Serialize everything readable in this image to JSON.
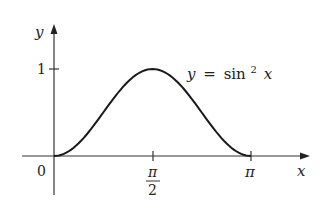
{
  "chart_data": {
    "type": "line",
    "title": "",
    "equation_label": "y = sin² x",
    "equation_parts": {
      "lhs": "y",
      "eq": "=",
      "fn": "sin",
      "exp": "2",
      "var": "x"
    },
    "xlabel": "x",
    "ylabel": "y",
    "xlim": [
      0,
      3.14159
    ],
    "ylim": [
      0,
      1
    ],
    "grid": false,
    "legend": "none",
    "x_ticks": [
      {
        "value": 0,
        "label": "0"
      },
      {
        "value": 1.5708,
        "label_num": "π",
        "label_den": "2"
      },
      {
        "value": 3.14159,
        "label": "π"
      }
    ],
    "y_ticks": [
      {
        "value": 1,
        "label": "1"
      }
    ],
    "series": [
      {
        "name": "y = sin² x",
        "x": [
          0,
          0.3927,
          0.7854,
          1.1781,
          1.5708,
          1.9635,
          2.3562,
          2.7489,
          3.14159
        ],
        "values": [
          0,
          0.1464,
          0.5,
          0.8536,
          1,
          0.8536,
          0.5,
          0.1464,
          0
        ]
      }
    ],
    "color": "#1a1a1a"
  }
}
